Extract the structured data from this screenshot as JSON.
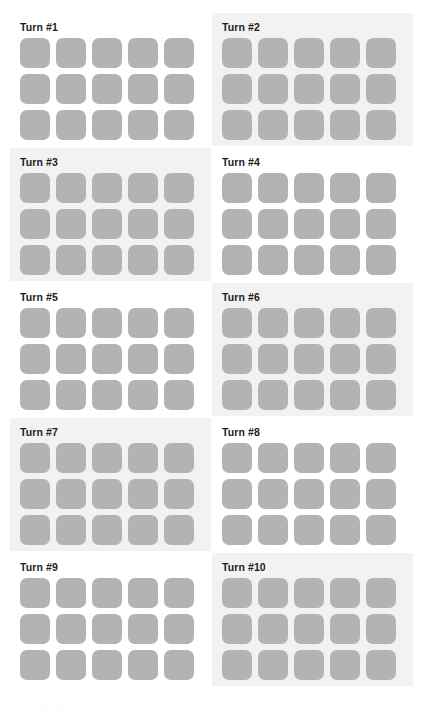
{
  "page": {
    "background_color": "#ffffff",
    "width": 423,
    "height": 722,
    "columns": 2,
    "rows": 5,
    "footer_note": "Turn grid"
  },
  "style": {
    "tile_color": "#b3b3b3",
    "panel_shaded_color": "#f2f2f2",
    "panel_plain_color": "#ffffff",
    "title_color": "#1d1d1d"
  },
  "board": {
    "grid_columns": 5,
    "grid_rows": 3,
    "tile_count": 15
  },
  "turns": [
    {
      "title": "Turn #1",
      "shaded": false,
      "col": 0,
      "row": 0
    },
    {
      "title": "Turn #2",
      "shaded": true,
      "col": 1,
      "row": 0
    },
    {
      "title": "Turn #3",
      "shaded": true,
      "col": 0,
      "row": 1
    },
    {
      "title": "Turn #4",
      "shaded": false,
      "col": 1,
      "row": 1
    },
    {
      "title": "Turn #5",
      "shaded": false,
      "col": 0,
      "row": 2
    },
    {
      "title": "Turn #6",
      "shaded": true,
      "col": 1,
      "row": 2
    },
    {
      "title": "Turn #7",
      "shaded": true,
      "col": 0,
      "row": 3
    },
    {
      "title": "Turn #8",
      "shaded": false,
      "col": 1,
      "row": 3
    },
    {
      "title": "Turn #9",
      "shaded": false,
      "col": 0,
      "row": 4
    },
    {
      "title": "Turn #10",
      "shaded": true,
      "col": 1,
      "row": 4
    }
  ]
}
